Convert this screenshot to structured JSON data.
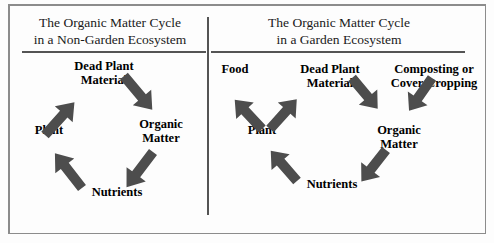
{
  "figure": {
    "background_color": "#fdfdfd",
    "frame_color": "#8c8c8c",
    "rule_color": "#545454",
    "arrow_color": "#4d4d4d",
    "text_color": "#000000"
  },
  "panels": [
    {
      "id": "non-garden",
      "title": "The Organic Matter Cycle\nin a Non-Garden Ecosystem",
      "nodes": [
        {
          "id": "dead-plant-material",
          "label": "Dead Plant\nMaterial"
        },
        {
          "id": "organic-matter",
          "label": "Organic\nMatter"
        },
        {
          "id": "nutrients",
          "label": "Nutrients"
        },
        {
          "id": "plant",
          "label": "Plant"
        }
      ],
      "arrows": [
        {
          "from": "plant",
          "to": "dead-plant-material"
        },
        {
          "from": "dead-plant-material",
          "to": "organic-matter"
        },
        {
          "from": "organic-matter",
          "to": "nutrients"
        },
        {
          "from": "nutrients",
          "to": "plant"
        }
      ]
    },
    {
      "id": "garden",
      "title": "The Organic Matter Cycle\nin a Garden Ecosystem",
      "nodes": [
        {
          "id": "food",
          "label": "Food"
        },
        {
          "id": "dead-plant-material",
          "label": "Dead Plant\nMaterial"
        },
        {
          "id": "composting-cover-cropping",
          "label": "Composting or\nCover Cropping"
        },
        {
          "id": "plant",
          "label": "Plant"
        },
        {
          "id": "organic-matter",
          "label": "Organic\nMatter"
        },
        {
          "id": "nutrients",
          "label": "Nutrients"
        }
      ],
      "arrows": [
        {
          "from": "plant",
          "to": "food"
        },
        {
          "from": "plant",
          "to": "dead-plant-material"
        },
        {
          "from": "dead-plant-material",
          "to": "organic-matter"
        },
        {
          "from": "composting-cover-cropping",
          "to": "organic-matter"
        },
        {
          "from": "organic-matter",
          "to": "nutrients"
        },
        {
          "from": "nutrients",
          "to": "plant"
        }
      ]
    }
  ]
}
